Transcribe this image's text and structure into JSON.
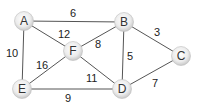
{
  "diagram": {
    "type": "weighted-undirected-graph",
    "nodes": [
      {
        "id": "A",
        "label": "A",
        "x": 24,
        "y": 21
      },
      {
        "id": "B",
        "label": "B",
        "x": 124,
        "y": 22
      },
      {
        "id": "C",
        "label": "C",
        "x": 181,
        "y": 56
      },
      {
        "id": "D",
        "label": "D",
        "x": 122,
        "y": 89
      },
      {
        "id": "E",
        "label": "E",
        "x": 22,
        "y": 89
      },
      {
        "id": "F",
        "label": "F",
        "x": 73,
        "y": 51
      }
    ],
    "edges": [
      {
        "from": "A",
        "to": "B",
        "weight": "6",
        "lx": 70,
        "ly": 17
      },
      {
        "from": "A",
        "to": "F",
        "weight": "12",
        "lx": 58,
        "ly": 38
      },
      {
        "from": "A",
        "to": "E",
        "weight": "10",
        "lx": 6,
        "ly": 57
      },
      {
        "from": "F",
        "to": "B",
        "weight": "8",
        "lx": 95,
        "ly": 48
      },
      {
        "from": "B",
        "to": "D",
        "weight": "5",
        "lx": 127,
        "ly": 60
      },
      {
        "from": "B",
        "to": "C",
        "weight": "3",
        "lx": 154,
        "ly": 36
      },
      {
        "from": "F",
        "to": "E",
        "weight": "16",
        "lx": 36,
        "ly": 69
      },
      {
        "from": "F",
        "to": "D",
        "weight": "11",
        "lx": 86,
        "ly": 82
      },
      {
        "from": "E",
        "to": "D",
        "weight": "9",
        "lx": 65,
        "ly": 102
      },
      {
        "from": "D",
        "to": "C",
        "weight": "7",
        "lx": 152,
        "ly": 87
      }
    ],
    "colors": {
      "edge": "#555555",
      "node_fill_center": "#ffffff",
      "node_fill_edge": "#cfcfcf",
      "node_stroke": "#bdbdbd",
      "text": "#222222"
    }
  }
}
